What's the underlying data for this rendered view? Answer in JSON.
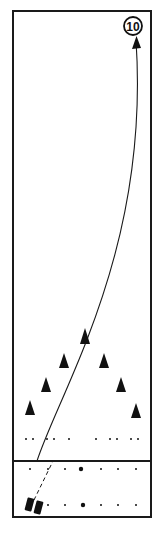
{
  "diagram": {
    "type": "bowling-lane-shot",
    "target_pin": {
      "label": "10",
      "cx": 133,
      "cy": 26,
      "r": 9
    },
    "lane": {
      "x": 13,
      "y": 11,
      "width": 138,
      "height": 506,
      "foul_line_y": 461
    },
    "colors": {
      "stroke": "#1a1a1a",
      "background": "#ffffff",
      "fill": "#111111"
    },
    "arrows": [
      {
        "name": "ball-path",
        "from": [
          37,
          461
        ],
        "via": [
          118,
          280
        ],
        "to": [
          136,
          38
        ]
      }
    ],
    "approach_path": {
      "from": [
        34,
        500
      ],
      "to": [
        53,
        461
      ],
      "style": "dashed"
    },
    "targets": [
      {
        "x": 30,
        "y": 407
      },
      {
        "x": 46,
        "y": 385
      },
      {
        "x": 64,
        "y": 361
      },
      {
        "x": 85,
        "y": 337
      },
      {
        "x": 104,
        "y": 362
      },
      {
        "x": 121,
        "y": 385
      },
      {
        "x": 136,
        "y": 410
      }
    ],
    "lane_dots": [
      {
        "x": 26,
        "y": 439
      },
      {
        "x": 33,
        "y": 439
      },
      {
        "x": 47,
        "y": 439
      },
      {
        "x": 54,
        "y": 439
      },
      {
        "x": 69,
        "y": 439
      },
      {
        "x": 96,
        "y": 439
      },
      {
        "x": 110,
        "y": 439
      },
      {
        "x": 117,
        "y": 439
      },
      {
        "x": 131,
        "y": 439
      },
      {
        "x": 138,
        "y": 439
      }
    ],
    "approach_dots_row1": [
      {
        "x": 30,
        "y": 469,
        "big": false
      },
      {
        "x": 48,
        "y": 469,
        "big": false
      },
      {
        "x": 65,
        "y": 469,
        "big": false
      },
      {
        "x": 81,
        "y": 469,
        "big": true
      },
      {
        "x": 101,
        "y": 469,
        "big": false
      },
      {
        "x": 118,
        "y": 469,
        "big": false
      },
      {
        "x": 136,
        "y": 469,
        "big": false
      }
    ],
    "approach_dots_row2": [
      {
        "x": 48,
        "y": 505,
        "big": false
      },
      {
        "x": 65,
        "y": 505,
        "big": false
      },
      {
        "x": 83,
        "y": 505,
        "big": true
      },
      {
        "x": 101,
        "y": 505,
        "big": false
      },
      {
        "x": 118,
        "y": 505,
        "big": false
      },
      {
        "x": 136,
        "y": 505,
        "big": false
      }
    ],
    "bowler_feet": [
      {
        "x": 30,
        "y": 505,
        "angle": 15
      },
      {
        "x": 38,
        "y": 507,
        "angle": 15
      }
    ]
  }
}
